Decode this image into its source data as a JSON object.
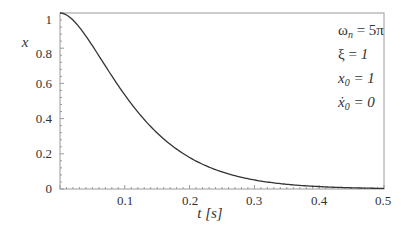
{
  "chart_data": {
    "type": "line",
    "title": "",
    "xlabel": "t [s]",
    "ylabel": "x",
    "xlim": [
      0,
      0.5
    ],
    "ylim": [
      0,
      1
    ],
    "grid": false,
    "x_ticks": [
      "0.1",
      "0.2",
      "0.3",
      "0.4",
      "0.5"
    ],
    "y_ticks": [
      "0",
      "0.2",
      "0.4",
      "0.6",
      "0.8",
      "1"
    ],
    "series": [
      {
        "name": "x(t) critically damped response",
        "color": "#333333",
        "x": [
          0,
          0.05,
          0.1,
          0.15,
          0.2,
          0.25,
          0.3,
          0.35,
          0.4,
          0.45,
          0.5
        ],
        "values": [
          1.0,
          0.815,
          0.535,
          0.314,
          0.173,
          0.091,
          0.046,
          0.023,
          0.011,
          0.005,
          0.002
        ]
      }
    ],
    "parameters": {
      "omega_n": 15.708,
      "xi": 1,
      "x0": 1,
      "v0": 0
    },
    "annotations": [
      "ωn = 5π",
      "ξ = 1",
      "x0 = 1",
      "ẋ0 = 0"
    ]
  },
  "labels": {
    "y_axis": "x",
    "x_axis": "t [s]",
    "ann_omega": "ω",
    "ann_omega_sub": "n",
    "ann_omega_rhs": " = 5π",
    "ann_xi": "ξ = ",
    "ann_xi_val": "1",
    "ann_x0": "x",
    "ann_x0_sub": "0",
    "ann_x0_rhs": " = 1",
    "ann_v0": "ẋ",
    "ann_v0_sub": "0",
    "ann_v0_rhs": " = 0"
  }
}
